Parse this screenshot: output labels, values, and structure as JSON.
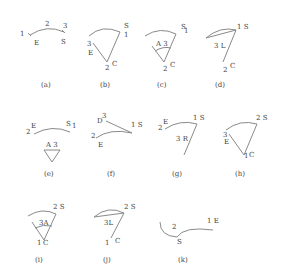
{
  "colors": {
    "line": "#8a8a8a",
    "text": "#444444",
    "background": "#ffffff"
  },
  "panels": [
    {
      "id": "a",
      "caption": "(a)",
      "labels": {
        "p1": "1",
        "e": "E",
        "p2": "2",
        "p3": "3",
        "s": "S"
      }
    },
    {
      "id": "b",
      "caption": "(b)",
      "labels": {
        "s": "S",
        "p1": "1",
        "p3": "3",
        "e": "E",
        "p2": "2",
        "c": "C"
      }
    },
    {
      "id": "c",
      "caption": "(c)",
      "labels": {
        "s": "S",
        "p1": "1",
        "a3": "A 3",
        "p2": "2",
        "c": "C"
      }
    },
    {
      "id": "d",
      "caption": "(d)",
      "labels": {
        "p1s": "1 S",
        "l3": "3 L",
        "p2": "2",
        "c": "C"
      }
    },
    {
      "id": "e",
      "caption": "(e)",
      "labels": {
        "p2": "2",
        "e": "E",
        "s": "S",
        "p1": "1",
        "a3": "A 3"
      }
    },
    {
      "id": "f",
      "caption": "(f)",
      "labels": {
        "d": "D",
        "p3": "3",
        "p1s": "1 S",
        "p2": "2",
        "e": "E"
      }
    },
    {
      "id": "g",
      "caption": "(g)",
      "labels": {
        "p2": "2",
        "e": "E",
        "p1s": "1 S",
        "r3": "3 R"
      }
    },
    {
      "id": "h",
      "caption": "(h)",
      "labels": {
        "p2s": "2 S",
        "p3": "3",
        "e": "E",
        "p1": "1",
        "c": "C"
      }
    },
    {
      "id": "i",
      "caption": "(i)",
      "labels": {
        "p2s": "2 S",
        "a3": "3A",
        "p1": "1",
        "c": "C"
      }
    },
    {
      "id": "j",
      "caption": "(j)",
      "labels": {
        "p2s": "2 S",
        "l3": "3L",
        "p1": "1",
        "c": "C"
      }
    },
    {
      "id": "k",
      "caption": "(k)",
      "labels": {
        "p1e": "1 E",
        "p2": "2",
        "s": "S"
      }
    }
  ]
}
